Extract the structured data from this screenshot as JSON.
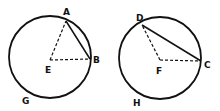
{
  "figures": [
    {
      "name": "left-circle",
      "center": {
        "label": "E",
        "x": 50,
        "y": 60
      },
      "circle": {
        "cx": 50,
        "cy": 57,
        "r": 41
      },
      "points": [
        {
          "label": "A",
          "x": 66,
          "y": 21,
          "label_x": 63,
          "label_y": 15
        },
        {
          "label": "B",
          "x": 90,
          "y": 59,
          "label_x": 93,
          "label_y": 63
        }
      ],
      "center_label": {
        "text": "E",
        "x": 45,
        "y": 73
      },
      "arc_label": {
        "text": "G",
        "x": 22,
        "y": 104
      },
      "chord": {
        "from": "A",
        "to": "B",
        "style": "solid"
      },
      "radii": [
        {
          "from": "E",
          "to": "A",
          "style": "dashed"
        },
        {
          "from": "E",
          "to": "B",
          "style": "dashed"
        }
      ]
    },
    {
      "name": "right-circle",
      "center": {
        "label": "F",
        "x": 160,
        "y": 60
      },
      "circle": {
        "cx": 160,
        "cy": 58,
        "r": 41
      },
      "points": [
        {
          "label": "D",
          "x": 142,
          "y": 25,
          "label_x": 136,
          "label_y": 21
        },
        {
          "label": "C",
          "x": 201,
          "y": 61,
          "label_x": 204,
          "label_y": 68
        }
      ],
      "center_label": {
        "text": "F",
        "x": 156,
        "y": 74
      },
      "arc_label": {
        "text": "H",
        "x": 133,
        "y": 106
      },
      "chord": {
        "from": "D",
        "to": "C",
        "style": "solid"
      },
      "radii": [
        {
          "from": "F",
          "to": "D",
          "style": "dashed"
        },
        {
          "from": "F",
          "to": "C",
          "style": "dashed"
        }
      ]
    }
  ],
  "labels": {
    "A": "A",
    "B": "B",
    "C": "C",
    "D": "D",
    "E": "E",
    "F": "F",
    "G": "G",
    "H": "H"
  }
}
